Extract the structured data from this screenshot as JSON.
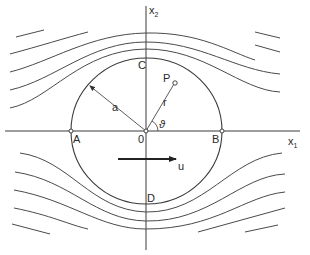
{
  "figure": {
    "axes": {
      "x_label": "x",
      "x_sub": "1",
      "y_label": "x",
      "y_sub": "2"
    },
    "points": {
      "A": "A",
      "B": "B",
      "C": "C",
      "D": "D",
      "origin": "0",
      "P": "P"
    },
    "labels": {
      "radius": "a",
      "r": "r",
      "theta": "ϑ",
      "velocity": "u"
    },
    "colors": {
      "ink": "#3a3a3a",
      "background": "#ffffff"
    }
  }
}
